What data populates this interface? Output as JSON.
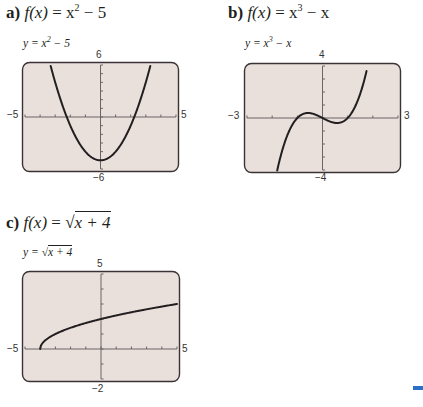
{
  "panels": [
    {
      "id": "a",
      "label": "a)",
      "heading": "f(x) = x² − 5",
      "heading_parts": {
        "prefix": "a)",
        "fx": "f(x)",
        "eq": " = x",
        "sup": "2",
        "rest": " − 5"
      },
      "eq_label": {
        "lhs": "y = x",
        "sup": "2",
        "rest": " − 5"
      },
      "ticks": {
        "xmin": "−5",
        "xmax": "5",
        "ymin": "−6",
        "ymax": "6"
      }
    },
    {
      "id": "b",
      "label": "b)",
      "heading_parts": {
        "prefix": "b)",
        "fx": "f(x)",
        "eq": " = x",
        "sup": "3",
        "rest": " − x"
      },
      "eq_label": {
        "lhs": "y = x",
        "sup": "3",
        "rest": " − x"
      },
      "ticks": {
        "xmin": "−3",
        "xmax": "3",
        "ymin": "−4",
        "ymax": "4"
      }
    },
    {
      "id": "c",
      "label": "c)",
      "heading_parts": {
        "prefix": "c)",
        "fx": "f(x)",
        "eq": " = ",
        "radicand": "x + 4"
      },
      "eq_label": {
        "lhs": "y = ",
        "radicand": "x + 4"
      },
      "ticks": {
        "xmin": "−5",
        "xmax": "5",
        "ymin": "−2",
        "ymax": "5"
      }
    }
  ],
  "colors": {
    "plot_bg": "#e9e0dc",
    "frame": "#3a3335",
    "curve": "#231f20",
    "accent": "#2a6fc9"
  },
  "chart_data": [
    {
      "type": "line",
      "title": "a) f(x) = x^2 - 5",
      "legend": "y = x^2 - 5",
      "xlabel": "",
      "ylabel": "",
      "xlim": [
        -5,
        5
      ],
      "ylim": [
        -6,
        6
      ],
      "x_tick_labels": [
        "-5",
        "5"
      ],
      "y_tick_labels": [
        "-6",
        "6"
      ],
      "x_tick_step": 1,
      "y_tick_step": 1,
      "grid": false,
      "x": [
        -3.3,
        -3,
        -2.5,
        -2,
        -1.5,
        -1,
        -0.5,
        0,
        0.5,
        1,
        1.5,
        2,
        2.5,
        3,
        3.3
      ],
      "values": [
        5.89,
        4,
        1.25,
        -1,
        -2.75,
        -4,
        -4.75,
        -5,
        -4.75,
        -4,
        -2.75,
        -1,
        1.25,
        4,
        5.89
      ]
    },
    {
      "type": "line",
      "title": "b) f(x) = x^3 - x",
      "legend": "y = x^3 - x",
      "xlabel": "",
      "ylabel": "",
      "xlim": [
        -3,
        3
      ],
      "ylim": [
        -4,
        4
      ],
      "x_tick_labels": [
        "-3",
        "3"
      ],
      "y_tick_labels": [
        "-4",
        "4"
      ],
      "x_tick_step": 1,
      "y_tick_step": 1,
      "grid": false,
      "x": [
        -1.8,
        -1.5,
        -1.2,
        -1,
        -0.8,
        -0.577,
        -0.3,
        0,
        0.3,
        0.577,
        0.8,
        1,
        1.2,
        1.5,
        1.75
      ],
      "values": [
        -4.03,
        -1.88,
        -0.53,
        0,
        0.29,
        0.385,
        0.27,
        0,
        -0.27,
        -0.385,
        -0.29,
        0,
        0.53,
        1.88,
        3.61
      ]
    },
    {
      "type": "line",
      "title": "c) f(x) = sqrt(x + 4)",
      "legend": "y = sqrt(x + 4)",
      "xlabel": "",
      "ylabel": "",
      "xlim": [
        -5,
        5
      ],
      "ylim": [
        -2,
        5
      ],
      "x_tick_labels": [
        "-5",
        "5"
      ],
      "y_tick_labels": [
        "-2",
        "5"
      ],
      "x_tick_step": 1,
      "y_tick_step": 1,
      "grid": false,
      "x": [
        -4,
        -3.9,
        -3.5,
        -3,
        -2,
        -1,
        0,
        1,
        2,
        3,
        4,
        5
      ],
      "values": [
        0,
        0.32,
        0.71,
        1,
        1.41,
        1.73,
        2,
        2.24,
        2.45,
        2.65,
        2.83,
        3
      ]
    }
  ]
}
